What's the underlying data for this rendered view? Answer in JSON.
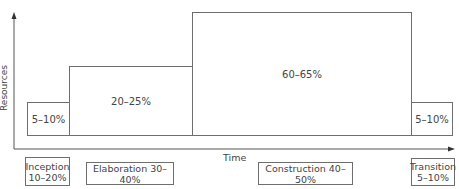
{
  "axes": {
    "y_label": "Resources",
    "x_label": "Time"
  },
  "bars": [
    {
      "label": "5–10%"
    },
    {
      "label": "20–25%"
    },
    {
      "label": "60–65%"
    },
    {
      "label": "5–10%"
    }
  ],
  "phases": [
    {
      "name": "Inception",
      "range": "10–20%"
    },
    {
      "name": "Elaboration",
      "range": "30–40%"
    },
    {
      "name": "Construction",
      "range": "40–50%"
    },
    {
      "name": "Transition",
      "range": "5–10%"
    }
  ],
  "phase_labels": {
    "elaboration": "Elaboration 30–40%",
    "construction": "Construction 40–50%"
  },
  "colors": {
    "line": "#6e6e6e",
    "text": "#444444"
  }
}
